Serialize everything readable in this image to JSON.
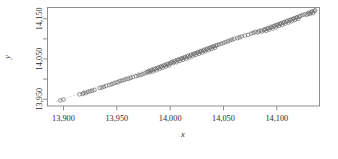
{
  "chart_data": {
    "type": "scatter",
    "title": "",
    "xlabel": "x",
    "ylabel": "y",
    "xlim": [
      13885,
      14140
    ],
    "ylim": [
      13933,
      14178
    ],
    "xticks": [
      13900,
      13950,
      14000,
      14050,
      14100
    ],
    "xticklabels": [
      "13,900",
      "13,950",
      "14,000",
      "14,050",
      "14,100"
    ],
    "yticks": [
      13950,
      14050,
      14150
    ],
    "yticklabels": [
      "13,950",
      "14,050",
      "14,150"
    ],
    "yminorticks": [
      14000,
      14100
    ],
    "grid": false,
    "legend": null,
    "marker": "open-circle",
    "marker_color": "#6e6e6e",
    "trendline": {
      "visible": true,
      "style": "dashed",
      "color": "#b9b9b9",
      "from": [
        13893,
        13944
      ],
      "to": [
        14136,
        14172
      ]
    },
    "points": [
      [
        13897,
        13947
      ],
      [
        13900,
        13949
      ],
      [
        13915,
        13962
      ],
      [
        13918,
        13963
      ],
      [
        13919,
        13966
      ],
      [
        13921,
        13965
      ],
      [
        13923,
        13968
      ],
      [
        13925,
        13970
      ],
      [
        13927,
        13971
      ],
      [
        13929,
        13973
      ],
      [
        13934,
        13978
      ],
      [
        13936,
        13979
      ],
      [
        13938,
        13981
      ],
      [
        13940,
        13983
      ],
      [
        13943,
        13985
      ],
      [
        13945,
        13987
      ],
      [
        13947,
        13989
      ],
      [
        13949,
        13991
      ],
      [
        13951,
        13992
      ],
      [
        13953,
        13995
      ],
      [
        13955,
        13996
      ],
      [
        13957,
        13998
      ],
      [
        13959,
        14000
      ],
      [
        13961,
        14001
      ],
      [
        13963,
        14003
      ],
      [
        13965,
        14005
      ],
      [
        13968,
        14007
      ],
      [
        13970,
        14009
      ],
      [
        13972,
        14010
      ],
      [
        13974,
        14012
      ],
      [
        13976,
        14014
      ],
      [
        13978,
        14016
      ],
      [
        13979,
        14018
      ],
      [
        13980,
        14020
      ],
      [
        13981,
        14017
      ],
      [
        13982,
        14021
      ],
      [
        13983,
        14023
      ],
      [
        13984,
        14019
      ],
      [
        13985,
        14024
      ],
      [
        13986,
        14026
      ],
      [
        13987,
        14022
      ],
      [
        13988,
        14027
      ],
      [
        13989,
        14029
      ],
      [
        13990,
        14025
      ],
      [
        13991,
        14030
      ],
      [
        13992,
        14032
      ],
      [
        13993,
        14028
      ],
      [
        13994,
        14033
      ],
      [
        13995,
        14035
      ],
      [
        13996,
        14031
      ],
      [
        13997,
        14036
      ],
      [
        13998,
        14038
      ],
      [
        13999,
        14034
      ],
      [
        14000,
        14039
      ],
      [
        14001,
        14041
      ],
      [
        14002,
        14043
      ],
      [
        14003,
        14040
      ],
      [
        14004,
        14044
      ],
      [
        14005,
        14046
      ],
      [
        14006,
        14042
      ],
      [
        14007,
        14047
      ],
      [
        14008,
        14049
      ],
      [
        14009,
        14045
      ],
      [
        14010,
        14050
      ],
      [
        14011,
        14052
      ],
      [
        14012,
        14048
      ],
      [
        14013,
        14053
      ],
      [
        14014,
        14055
      ],
      [
        14015,
        14051
      ],
      [
        14016,
        14056
      ],
      [
        14017,
        14058
      ],
      [
        14018,
        14054
      ],
      [
        14019,
        14059
      ],
      [
        14020,
        14061
      ],
      [
        14021,
        14057
      ],
      [
        14022,
        14062
      ],
      [
        14023,
        14064
      ],
      [
        14024,
        14060
      ],
      [
        14025,
        14065
      ],
      [
        14026,
        14067
      ],
      [
        14027,
        14063
      ],
      [
        14028,
        14068
      ],
      [
        14029,
        14070
      ],
      [
        14030,
        14066
      ],
      [
        14031,
        14071
      ],
      [
        14032,
        14073
      ],
      [
        14033,
        14069
      ],
      [
        14034,
        14074
      ],
      [
        14035,
        14076
      ],
      [
        14036,
        14072
      ],
      [
        14037,
        14077
      ],
      [
        14038,
        14079
      ],
      [
        14039,
        14075
      ],
      [
        14040,
        14080
      ],
      [
        14041,
        14082
      ],
      [
        14042,
        14078
      ],
      [
        14043,
        14083
      ],
      [
        14044,
        14085
      ],
      [
        14046,
        14086
      ],
      [
        14048,
        14088
      ],
      [
        14050,
        14090
      ],
      [
        14052,
        14092
      ],
      [
        14054,
        14094
      ],
      [
        14056,
        14096
      ],
      [
        14058,
        14098
      ],
      [
        14060,
        14100
      ],
      [
        14063,
        14102
      ],
      [
        14065,
        14104
      ],
      [
        14067,
        14106
      ],
      [
        14070,
        14108
      ],
      [
        14073,
        14110
      ],
      [
        14076,
        14113
      ],
      [
        14078,
        14115
      ],
      [
        14080,
        14117
      ],
      [
        14082,
        14116
      ],
      [
        14083,
        14119
      ],
      [
        14085,
        14121
      ],
      [
        14086,
        14118
      ],
      [
        14088,
        14122
      ],
      [
        14089,
        14124
      ],
      [
        14090,
        14120
      ],
      [
        14091,
        14125
      ],
      [
        14092,
        14127
      ],
      [
        14093,
        14123
      ],
      [
        14094,
        14128
      ],
      [
        14095,
        14130
      ],
      [
        14096,
        14126
      ],
      [
        14097,
        14131
      ],
      [
        14098,
        14133
      ],
      [
        14099,
        14129
      ],
      [
        14100,
        14134
      ],
      [
        14101,
        14136
      ],
      [
        14102,
        14132
      ],
      [
        14103,
        14137
      ],
      [
        14104,
        14139
      ],
      [
        14105,
        14135
      ],
      [
        14106,
        14140
      ],
      [
        14107,
        14142
      ],
      [
        14108,
        14138
      ],
      [
        14109,
        14143
      ],
      [
        14110,
        14145
      ],
      [
        14111,
        14141
      ],
      [
        14112,
        14146
      ],
      [
        14113,
        14148
      ],
      [
        14114,
        14144
      ],
      [
        14115,
        14149
      ],
      [
        14116,
        14151
      ],
      [
        14117,
        14147
      ],
      [
        14118,
        14152
      ],
      [
        14119,
        14154
      ],
      [
        14120,
        14150
      ],
      [
        14121,
        14155
      ],
      [
        14122,
        14157
      ],
      [
        14124,
        14159
      ],
      [
        14126,
        14161
      ],
      [
        14128,
        14160
      ],
      [
        14129,
        14163
      ],
      [
        14130,
        14165
      ],
      [
        14131,
        14162
      ],
      [
        14132,
        14166
      ],
      [
        14133,
        14168
      ],
      [
        14134,
        14164
      ],
      [
        14135,
        14169
      ],
      [
        14136,
        14171
      ]
    ]
  }
}
